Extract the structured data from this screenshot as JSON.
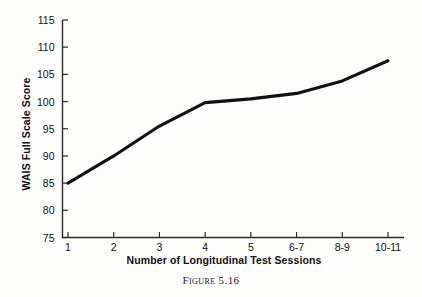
{
  "caption": "Figure 5.16",
  "chart_data": {
    "type": "line",
    "title": "",
    "subtitle": "",
    "xlabel": "Number of Longitudinal Test Sessions",
    "ylabel": "WAIS Full Scale Score",
    "categories": [
      "1",
      "2",
      "3",
      "4",
      "5",
      "6-7",
      "8-9",
      "10-11"
    ],
    "values": [
      85.0,
      90.0,
      95.5,
      99.8,
      100.5,
      101.5,
      103.8,
      107.5
    ],
    "series": [
      {
        "name": "WAIS Full Scale Score",
        "values": [
          85.0,
          90.0,
          95.5,
          99.8,
          100.5,
          101.5,
          103.8,
          107.5
        ]
      }
    ],
    "ylim": [
      75,
      115
    ],
    "yticks": [
      75,
      80,
      85,
      90,
      95,
      100,
      105,
      110,
      115
    ],
    "ytick_labels": [
      "75",
      "80",
      "85",
      "90",
      "95",
      "100",
      "105",
      "110",
      "115"
    ],
    "xtick_labels": [
      "1",
      "2",
      "3",
      "4",
      "5",
      "6-7",
      "8-9",
      "10-11"
    ],
    "grid": false,
    "legend": "none",
    "line_color": "#111111"
  },
  "axis": {
    "y_title": "WAIS Full Scale Score",
    "x_title": "Number of Longitudinal Test Sessions"
  }
}
